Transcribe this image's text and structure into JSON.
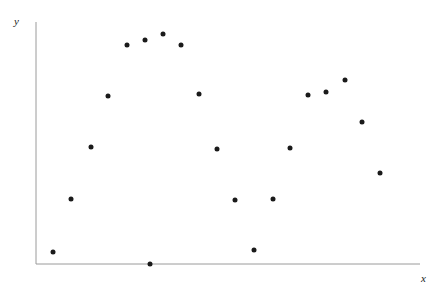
{
  "chart_data": {
    "type": "scatter",
    "title": "",
    "subtitle": "",
    "xlabel": "x",
    "ylabel": "y",
    "xlim": [
      0,
      100
    ],
    "ylim": [
      0,
      100
    ],
    "grid": false,
    "legend": null,
    "annotations": [],
    "tick_labels": {
      "x": [],
      "y": []
    },
    "marker": {
      "shape": "circle",
      "color": "#1a1a1a",
      "size_px": 5
    },
    "axis": {
      "color": "#9a9a9a",
      "width_px": 1,
      "origin_px": {
        "x": 36,
        "y": 264
      },
      "x_end_px": 420,
      "y_top_px": 22
    },
    "n_points": 20,
    "series": [
      {
        "name": "observations",
        "points": [
          {
            "x": 4.4,
            "y": 4.9,
            "px": 53,
            "py": 252
          },
          {
            "x": 9.1,
            "y": 26.9,
            "px": 71,
            "py": 199
          },
          {
            "x": 14.3,
            "y": 48.3,
            "px": 91,
            "py": 147
          },
          {
            "x": 18.8,
            "y": 69.4,
            "px": 108,
            "py": 96
          },
          {
            "x": 23.7,
            "y": 90.5,
            "px": 127,
            "py": 45
          },
          {
            "x": 28.4,
            "y": 92.6,
            "px": 145,
            "py": 40
          },
          {
            "x": 33.1,
            "y": 95.0,
            "px": 163,
            "py": 34
          },
          {
            "x": 37.8,
            "y": 90.5,
            "px": 181,
            "py": 45
          },
          {
            "x": 42.4,
            "y": 70.2,
            "px": 199,
            "py": 94
          },
          {
            "x": 47.1,
            "y": 47.5,
            "px": 217,
            "py": 149
          },
          {
            "x": 51.8,
            "y": 26.4,
            "px": 235,
            "py": 200
          },
          {
            "x": 56.8,
            "y": 5.8,
            "px": 254,
            "py": 250
          },
          {
            "x": 61.7,
            "y": 26.9,
            "px": 273,
            "py": 199
          },
          {
            "x": 66.1,
            "y": 47.9,
            "px": 290,
            "py": 148
          },
          {
            "x": 70.8,
            "y": 69.8,
            "px": 308,
            "py": 95
          },
          {
            "x": 75.5,
            "y": 71.1,
            "px": 326,
            "py": 92
          },
          {
            "x": 80.5,
            "y": 76.0,
            "px": 345,
            "py": 80
          },
          {
            "x": 84.9,
            "y": 58.7,
            "px": 362,
            "py": 122
          },
          {
            "x": 89.6,
            "y": 37.6,
            "px": 380,
            "py": 173
          },
          {
            "x": 31.0,
            "y": 0.0,
            "px": 150,
            "py": 264
          }
        ]
      }
    ]
  },
  "figure": {
    "background": "#ffffff",
    "y_axis_label": "y",
    "x_axis_label": "x"
  }
}
